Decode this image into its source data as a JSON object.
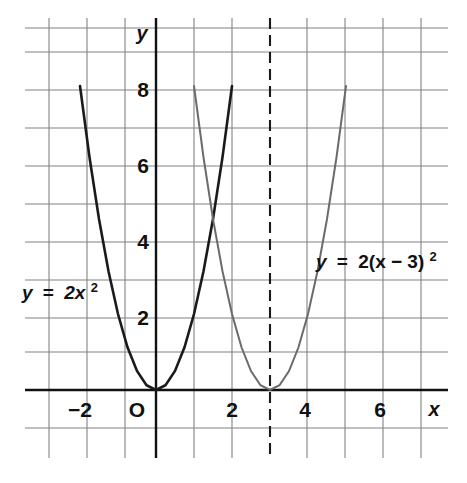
{
  "figure": {
    "background_color": "#ffffff",
    "grid_color": "#5a5a5a",
    "axis_color": "#111111",
    "curve_primary_color": "#1a1a1a",
    "curve_secondary_color": "#6b6b6b"
  },
  "axes": {
    "x_axis_name": "x",
    "y_axis_name": "y",
    "origin_label": "O",
    "x_tick_labels": [
      "−2",
      "2",
      "4",
      "6"
    ],
    "y_tick_labels": [
      "2",
      "4",
      "6",
      "8"
    ]
  },
  "annotations": {
    "curve1": {
      "lhs": "y",
      "eq": "=",
      "rhs_base": "2x",
      "rhs_sup": "2",
      "full": "y = 2x²"
    },
    "curve2": {
      "lhs": "y",
      "eq": "=",
      "rhs_base": "2(x − 3)",
      "rhs_sup": "2",
      "full": "y = 2(x − 3)²"
    }
  },
  "chart_data": {
    "type": "line",
    "title": "",
    "xlabel": "x",
    "ylabel": "y",
    "xlim": [
      -3.45,
      7.7
    ],
    "ylim": [
      -1.1,
      9.8
    ],
    "grid": true,
    "legend": "inline-annotations",
    "x_ticks": [
      -2,
      0,
      2,
      4,
      6
    ],
    "y_ticks": [
      0,
      2,
      4,
      6,
      8
    ],
    "grid_step": 1,
    "vertical_dashed_line_x": 3,
    "series": [
      {
        "name": "y = 2x²",
        "equation": "y = 2*x^2",
        "color": "#1a1a1a",
        "vertex": [
          0,
          0
        ],
        "x_range": [
          -2,
          2
        ],
        "x": [
          -2,
          -1.75,
          -1.5,
          -1.25,
          -1,
          -0.75,
          -0.5,
          -0.25,
          0,
          0.25,
          0.5,
          0.75,
          1,
          1.25,
          1.5,
          1.75,
          2
        ],
        "y": [
          8,
          6.125,
          4.5,
          3.125,
          2,
          1.125,
          0.5,
          0.125,
          0,
          0.125,
          0.5,
          1.125,
          2,
          3.125,
          4.5,
          6.125,
          8
        ]
      },
      {
        "name": "y = 2(x − 3)²",
        "equation": "y = 2*(x-3)^2",
        "color": "#6b6b6b",
        "vertex": [
          3,
          0
        ],
        "x_range": [
          1,
          5
        ],
        "x": [
          1,
          1.25,
          1.5,
          1.75,
          2,
          2.25,
          2.5,
          2.75,
          3,
          3.25,
          3.5,
          3.75,
          4,
          4.25,
          4.5,
          4.75,
          5
        ],
        "y": [
          8,
          6.125,
          4.5,
          3.125,
          2,
          1.125,
          0.5,
          0.125,
          0,
          0.125,
          0.5,
          1.125,
          2,
          3.125,
          4.5,
          6.125,
          8
        ]
      }
    ]
  }
}
